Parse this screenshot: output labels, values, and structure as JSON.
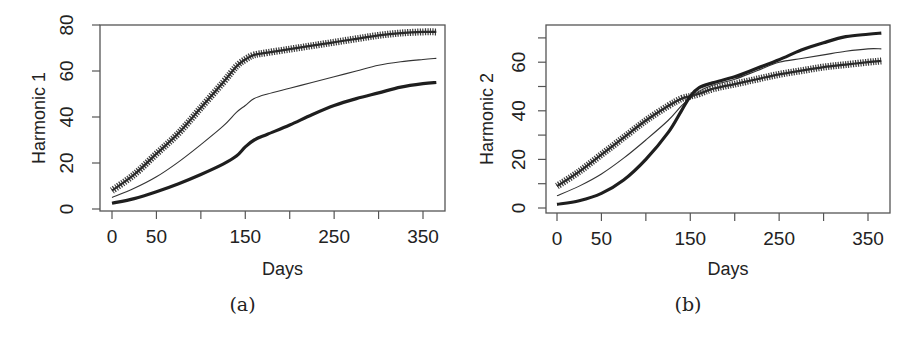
{
  "chart_data": [
    {
      "type": "line",
      "panel_label": "(a)",
      "title": "",
      "xlabel": "Days",
      "ylabel": "Harmonic 1",
      "xlim": [
        0,
        365
      ],
      "ylim": [
        0,
        80
      ],
      "xticks": [
        0,
        50,
        150,
        250,
        350
      ],
      "xtick_marks": [
        0,
        50,
        100,
        150,
        200,
        250,
        300,
        350
      ],
      "yticks": [
        0,
        20,
        40,
        60,
        80
      ],
      "grid": false,
      "legend": null,
      "x": [
        0,
        25,
        50,
        75,
        100,
        125,
        140,
        150,
        160,
        175,
        200,
        225,
        250,
        275,
        300,
        325,
        350,
        365
      ],
      "series": [
        {
          "name": "upper (cross markers)",
          "style": "crosses",
          "values": [
            8,
            15,
            24,
            33,
            44,
            55,
            62,
            65,
            67,
            68,
            69.5,
            71,
            72.5,
            74,
            75.5,
            76.5,
            77,
            77
          ]
        },
        {
          "name": "middle (thin line)",
          "style": "thin",
          "values": [
            5,
            9,
            14,
            20.5,
            28,
            36,
            42,
            45,
            48,
            50,
            52.5,
            55,
            57.5,
            60,
            62.5,
            64,
            65,
            65.5
          ]
        },
        {
          "name": "lower (thick line)",
          "style": "thick",
          "values": [
            2.5,
            4.5,
            7.5,
            11,
            15,
            19.5,
            23,
            27,
            30,
            32.5,
            36.5,
            41,
            45,
            48,
            50.5,
            53,
            54.5,
            55
          ]
        }
      ]
    },
    {
      "type": "line",
      "panel_label": "(b)",
      "title": "",
      "xlabel": "Days",
      "ylabel": "Harmonic 2",
      "xlim": [
        0,
        365
      ],
      "ylim": [
        0,
        72
      ],
      "xticks": [
        0,
        50,
        150,
        250,
        350
      ],
      "xtick_marks": [
        0,
        50,
        100,
        150,
        200,
        250,
        300,
        350
      ],
      "yticks": [
        0,
        20,
        40,
        60
      ],
      "ytick_marks": [
        0,
        10,
        20,
        30,
        40,
        50,
        60,
        70
      ],
      "grid": false,
      "legend": null,
      "x": [
        0,
        25,
        50,
        75,
        100,
        125,
        140,
        150,
        160,
        175,
        200,
        225,
        250,
        275,
        300,
        325,
        350,
        365
      ],
      "series": [
        {
          "name": "cross markers",
          "style": "crosses",
          "values": [
            9,
            15,
            22,
            29,
            36,
            42,
            45,
            46,
            47,
            49,
            51,
            53,
            55,
            56.5,
            58,
            59,
            60,
            60.5
          ]
        },
        {
          "name": "thin line",
          "style": "thin",
          "values": [
            5,
            9,
            14,
            20.5,
            28,
            36,
            42,
            45,
            48,
            50.5,
            53,
            56.5,
            60,
            61.5,
            63,
            64.5,
            65.5,
            65.5
          ]
        },
        {
          "name": "thick dashed line",
          "style": "thick",
          "values": [
            1.5,
            3,
            6,
            11.5,
            20,
            31,
            40,
            46,
            49.5,
            51.5,
            54,
            57.5,
            61,
            65,
            68,
            70.5,
            71.5,
            72
          ]
        }
      ]
    }
  ]
}
